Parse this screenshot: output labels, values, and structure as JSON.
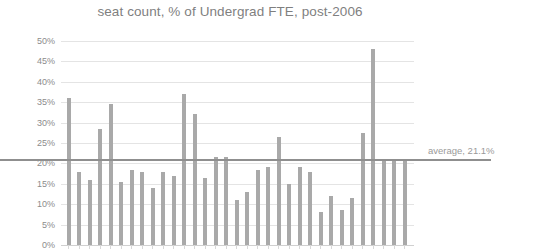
{
  "chart_data": {
    "type": "bar",
    "title": "seat count, % of Undergrad FTE, post-2006",
    "xlabel": "",
    "ylabel": "",
    "ylim": [
      0,
      50
    ],
    "ytick_step": 5,
    "ytick_labels": [
      "50%",
      "45%",
      "40%",
      "35%",
      "30%",
      "25%",
      "20%",
      "15%",
      "10%",
      "5%",
      "0%"
    ],
    "ytick_values": [
      50,
      45,
      40,
      35,
      30,
      25,
      20,
      15,
      10,
      5,
      0
    ],
    "grid": true,
    "legend": "none",
    "categories": [
      "1",
      "2",
      "3",
      "4",
      "5",
      "6",
      "7",
      "8",
      "9",
      "10",
      "11",
      "12",
      "13",
      "14",
      "15",
      "16",
      "17",
      "18",
      "19",
      "20",
      "21",
      "22",
      "23",
      "24",
      "25",
      "26",
      "27",
      "28",
      "29",
      "30",
      "31",
      "32",
      "33"
    ],
    "values": [
      36.0,
      18.0,
      16.0,
      28.5,
      34.5,
      15.5,
      18.5,
      18.0,
      14.0,
      18.0,
      17.0,
      37.0,
      32.0,
      16.5,
      21.5,
      21.5,
      11.0,
      13.0,
      18.5,
      19.0,
      26.5,
      15.0,
      19.0,
      18.0,
      8.0,
      12.0,
      8.5,
      11.5,
      27.5,
      48.0,
      21.0,
      21.0,
      20.5
    ],
    "bar_color": "#a9a9a9",
    "gridline_color": "#e4e4e4",
    "annotations": [
      {
        "name": "average-line",
        "label": "average, 21.1%",
        "value": 21.1,
        "orientation": "horizontal",
        "color": "#8f8f8f"
      }
    ]
  }
}
